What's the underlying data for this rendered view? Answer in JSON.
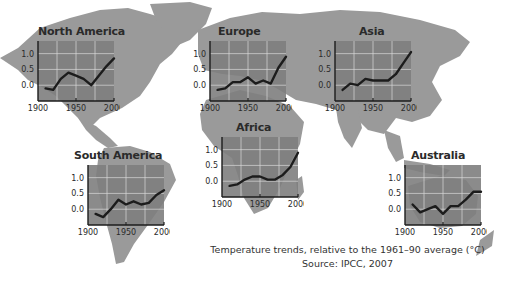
{
  "caption": {
    "line1": "Temperature trends, relative to the 1961–90 average (°C)",
    "line2": "Source: IPCC, 2007"
  },
  "colors": {
    "land": "#9a9a9a",
    "chart_bg": "#7e7e7e",
    "chart_light": "#b5b5b5",
    "line": "#1c1c1c",
    "grid": "#d8d8d8",
    "text": "#2a2a2a"
  },
  "chart_data": [
    {
      "type": "line",
      "title": "North America",
      "x": [
        1910,
        1920,
        1930,
        1940,
        1950,
        1960,
        1970,
        1980,
        1990,
        2000
      ],
      "values": [
        -0.1,
        -0.15,
        0.2,
        0.4,
        0.3,
        0.2,
        0.0,
        0.3,
        0.6,
        0.85
      ],
      "xticks": [
        "1900",
        "1950",
        "2000"
      ],
      "yticks": [
        "0.0",
        "0.5",
        "1.0"
      ],
      "xlim": [
        1900,
        2000
      ],
      "ylim": [
        -0.5,
        1.4
      ],
      "grid": true,
      "xlabel": "",
      "ylabel": ""
    },
    {
      "type": "line",
      "title": "Europe",
      "x": [
        1910,
        1920,
        1930,
        1940,
        1950,
        1960,
        1970,
        1980,
        1990,
        2000
      ],
      "values": [
        -0.15,
        -0.1,
        0.1,
        0.1,
        0.25,
        0.05,
        0.15,
        0.05,
        0.55,
        0.9
      ],
      "xticks": [
        "1900",
        "1950",
        "2000"
      ],
      "yticks": [
        "0.0",
        "0.5",
        "1.0"
      ],
      "xlim": [
        1900,
        2000
      ],
      "ylim": [
        -0.5,
        1.4
      ],
      "grid": true,
      "xlabel": "",
      "ylabel": ""
    },
    {
      "type": "line",
      "title": "Asia",
      "x": [
        1910,
        1920,
        1930,
        1940,
        1950,
        1960,
        1970,
        1980,
        1990,
        2000
      ],
      "values": [
        -0.15,
        0.05,
        0.0,
        0.2,
        0.15,
        0.15,
        0.15,
        0.35,
        0.7,
        1.05
      ],
      "xticks": [
        "1900",
        "1950",
        "2000"
      ],
      "yticks": [
        "0.0",
        "0.5",
        "1.0"
      ],
      "xlim": [
        1900,
        2000
      ],
      "ylim": [
        -0.5,
        1.4
      ],
      "grid": true,
      "xlabel": "",
      "ylabel": ""
    },
    {
      "type": "line",
      "title": "Africa",
      "x": [
        1910,
        1920,
        1930,
        1940,
        1950,
        1960,
        1970,
        1980,
        1990,
        2000
      ],
      "values": [
        -0.15,
        -0.1,
        0.05,
        0.15,
        0.15,
        0.05,
        0.05,
        0.2,
        0.45,
        0.9
      ],
      "xticks": [
        "1900",
        "1950",
        "2000"
      ],
      "yticks": [
        "0.0",
        "0.5",
        "1.0"
      ],
      "xlim": [
        1900,
        2000
      ],
      "ylim": [
        -0.5,
        1.4
      ],
      "grid": true,
      "xlabel": "",
      "ylabel": ""
    },
    {
      "type": "line",
      "title": "South America",
      "x": [
        1910,
        1920,
        1930,
        1940,
        1950,
        1960,
        1970,
        1980,
        1990,
        2000
      ],
      "values": [
        -0.15,
        -0.25,
        0.0,
        0.3,
        0.15,
        0.25,
        0.15,
        0.2,
        0.45,
        0.6
      ],
      "xticks": [
        "1900",
        "1950",
        "2000"
      ],
      "yticks": [
        "0.0",
        "0.5",
        "1.0"
      ],
      "xlim": [
        1900,
        2000
      ],
      "ylim": [
        -0.5,
        1.4
      ],
      "grid": true,
      "xlabel": "",
      "ylabel": ""
    },
    {
      "type": "line",
      "title": "Australia",
      "x": [
        1910,
        1920,
        1930,
        1940,
        1950,
        1960,
        1970,
        1980,
        1990,
        2000
      ],
      "values": [
        0.15,
        -0.1,
        0.0,
        0.1,
        -0.15,
        0.1,
        0.1,
        0.3,
        0.55,
        0.55
      ],
      "xticks": [
        "1900",
        "1950",
        "2000"
      ],
      "yticks": [
        "0.0",
        "0.5",
        "1.0"
      ],
      "xlim": [
        1900,
        2000
      ],
      "ylim": [
        -0.5,
        1.4
      ],
      "grid": true,
      "xlabel": "",
      "ylabel": ""
    }
  ]
}
